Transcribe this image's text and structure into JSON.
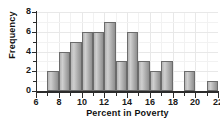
{
  "chart_data": {
    "type": "bar",
    "title": "",
    "subtitle": "",
    "xlabel": "Percent in Poverty",
    "ylabel": "Frequency",
    "xlim": [
      6,
      22
    ],
    "ylim": [
      0,
      8
    ],
    "xticks": [
      6,
      8,
      10,
      12,
      14,
      16,
      18,
      20,
      22
    ],
    "xtick_labels": [
      "6",
      "8",
      "10",
      "12",
      "14",
      "16",
      "18",
      "20",
      "22"
    ],
    "yticks": [
      0,
      2,
      4,
      6,
      8
    ],
    "ytick_labels": [
      "0",
      "2",
      "4",
      "6",
      "8"
    ],
    "yticks_minor": [
      1,
      3,
      5,
      7
    ],
    "grid": true,
    "legend": null,
    "bin_width": 1,
    "bins": [
      {
        "start": 7,
        "end": 8,
        "value": 2
      },
      {
        "start": 8,
        "end": 9,
        "value": 4
      },
      {
        "start": 9,
        "end": 10,
        "value": 5
      },
      {
        "start": 10,
        "end": 11,
        "value": 6
      },
      {
        "start": 11,
        "end": 12,
        "value": 6
      },
      {
        "start": 12,
        "end": 13,
        "value": 7
      },
      {
        "start": 13,
        "end": 14,
        "value": 3
      },
      {
        "start": 14,
        "end": 15,
        "value": 6
      },
      {
        "start": 15,
        "end": 16,
        "value": 3
      },
      {
        "start": 16,
        "end": 17,
        "value": 2
      },
      {
        "start": 17,
        "end": 18,
        "value": 3
      },
      {
        "start": 18,
        "end": 19,
        "value": 0
      },
      {
        "start": 19,
        "end": 20,
        "value": 2
      },
      {
        "start": 20,
        "end": 21,
        "value": 0
      },
      {
        "start": 21,
        "end": 22,
        "value": 1
      }
    ],
    "categories": [
      "7-8",
      "8-9",
      "9-10",
      "10-11",
      "11-12",
      "12-13",
      "13-14",
      "14-15",
      "15-16",
      "16-17",
      "17-18",
      "18-19",
      "19-20",
      "20-21",
      "21-22"
    ],
    "values": [
      2,
      4,
      5,
      6,
      6,
      7,
      3,
      6,
      3,
      2,
      3,
      0,
      2,
      0,
      1
    ],
    "colors": {
      "bar_fill": "#b4b4b4",
      "bar_edge": "#6b6b6b",
      "axis": "#2b2b2b",
      "grid": "#e8e8e8",
      "background": "#ffffff",
      "text": "#111111"
    }
  }
}
